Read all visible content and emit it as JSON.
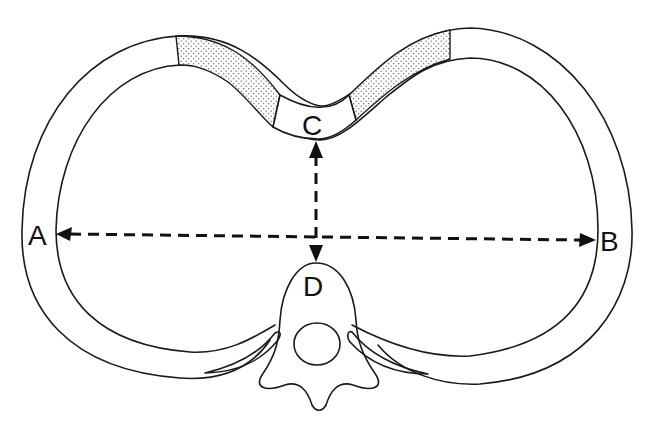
{
  "diagram": {
    "type": "anatomical cross-section (thorax, axial view)",
    "labels": {
      "A": "A",
      "B": "B",
      "C": "C",
      "D": "D"
    },
    "measurements": [
      {
        "name": "transverse-diameter",
        "from": "A",
        "to": "B",
        "style": "dashed double-arrow"
      },
      {
        "name": "anteroposterior-diameter",
        "from": "C",
        "to": "D",
        "style": "dashed double-arrow"
      }
    ],
    "structures": [
      {
        "name": "chest-wall-ring",
        "style": "outlined band"
      },
      {
        "name": "costal-cartilage-left",
        "style": "stippled"
      },
      {
        "name": "costal-cartilage-right",
        "style": "stippled"
      },
      {
        "name": "sternum",
        "label": "C"
      },
      {
        "name": "vertebral-body",
        "label": "D"
      },
      {
        "name": "spinal-canal"
      },
      {
        "name": "rib-head-left"
      },
      {
        "name": "rib-head-right"
      }
    ],
    "colors": {
      "line": "#1a1a1a",
      "background": "#ffffff",
      "stipple": "#555555"
    }
  }
}
